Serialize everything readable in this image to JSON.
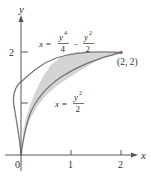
{
  "figure": {
    "type": "region-between-curves",
    "axes": {
      "x_label": "x",
      "y_label": "y",
      "origin_label": "0",
      "x_ticks": [
        "1",
        "2"
      ],
      "y_ticks": [
        "2"
      ],
      "y_minor_tick_at": 1
    },
    "curves": [
      {
        "name": "upper-left-boundary",
        "equation_lhs": "x =",
        "num1": "y",
        "exp1": "4",
        "den1": "4",
        "minus": "−",
        "num2": "y",
        "exp2": "2",
        "den2": "2"
      },
      {
        "name": "lower-right-boundary",
        "equation_lhs": "x =",
        "num": "y",
        "exp": "2",
        "den": "2"
      }
    ],
    "point_label": "(2, 2)",
    "colors": {
      "fill": "#d4d4d4",
      "curve": "#777777",
      "axis": "#555555",
      "text": "#333333"
    }
  }
}
